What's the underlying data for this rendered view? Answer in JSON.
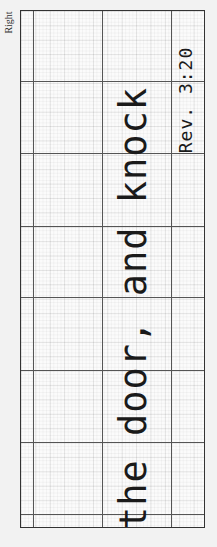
{
  "side_label": "Right",
  "worksheet": {
    "main_text": "the door, and knock",
    "reference": "Rev. 3:20"
  },
  "colors": {
    "background": "#f2f2f2",
    "paper": "#fbfbfb",
    "ink": "#1a1a1a",
    "grid_major": "#555555"
  }
}
